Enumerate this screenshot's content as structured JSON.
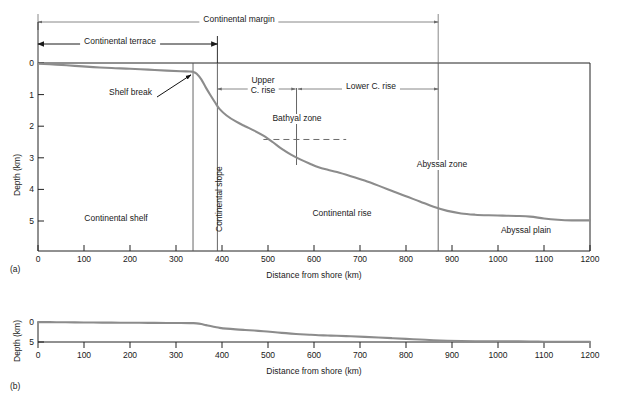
{
  "figure": {
    "panel_a_id": "(a)",
    "panel_b_id": "(b)",
    "x_axis_title": "Distance from shore (km)",
    "y_axis_title": "Depth (km)"
  },
  "axes": {
    "x_ticks": [
      0,
      100,
      200,
      300,
      400,
      500,
      600,
      700,
      800,
      900,
      1000,
      1100,
      1200
    ],
    "x_tick_labels": [
      "0",
      "100",
      "200",
      "300",
      "400",
      "500",
      "600",
      "700",
      "800",
      "900",
      "1000",
      "1100",
      "1200"
    ],
    "x_min": 0,
    "x_max": 1200,
    "y_ticks_a": [
      0,
      1,
      2,
      3,
      4,
      5
    ],
    "y_tick_labels_a": [
      "0",
      "1",
      "2",
      "3",
      "4",
      "5"
    ],
    "y_min_a": 0,
    "y_max_a": 5.6,
    "y_ticks_b": [
      0,
      5
    ],
    "y_tick_labels_b": [
      "0",
      "5"
    ],
    "y_min_b": 0,
    "y_max_b": 5.6
  },
  "brackets": {
    "continental_margin": {
      "label": "Continental margin",
      "start_km": 0,
      "end_km": 870
    },
    "continental_terrace": {
      "label": "Continental terrace",
      "start_km": 0,
      "end_km": 390
    },
    "upper_c_rise": {
      "label_line1": "Upper",
      "label_line2": "C. rise",
      "start_km": 390,
      "end_km": 560
    },
    "lower_c_rise": {
      "label": "Lower C. rise",
      "start_km": 565,
      "end_km": 870
    }
  },
  "annotations": {
    "shelf_break": {
      "label": "Shelf break",
      "point_km": 337,
      "point_depth": 0.28
    },
    "continental_shelf": {
      "label": "Continental shelf",
      "at_km": 170,
      "at_depth": 4.55
    },
    "continental_slope": {
      "label": "Continental slope",
      "at_km": 367,
      "at_depth": 3.1
    },
    "continental_rise": {
      "label": "Continental rise",
      "at_km": 660,
      "at_depth": 4.55
    },
    "bathyal_zone": {
      "label": "Bathyal zone",
      "at_km": 560,
      "at_depth": 2.05
    },
    "abyssal_zone": {
      "label": "Abyssal zone",
      "at_km": 870,
      "at_depth": 2.9
    },
    "abyssal_plain": {
      "label": "Abyssal plain",
      "at_km": 1060,
      "at_depth": 5.1
    }
  },
  "dividers": {
    "continental_slope_left_km": 337,
    "continental_slope_right_km": 390,
    "bathyal_divider_km": 562,
    "abyssal_divider_km": 870,
    "bathyal_dashed_start_km": 490,
    "bathyal_dashed_end_km": 670,
    "bathyal_dashed_depth": 2.42
  },
  "chart_data": {
    "type": "line",
    "title": "",
    "xlabel": "Distance from shore (km)",
    "ylabel": "Depth (km)",
    "xlim": [
      0,
      1200
    ],
    "ylim": [
      5.6,
      0
    ],
    "grid": false,
    "legend": "none",
    "series": [
      {
        "name": "Seafloor profile",
        "color": "#8c8c8c",
        "x": [
          0,
          40,
          80,
          120,
          160,
          200,
          240,
          280,
          310,
          330,
          337,
          345,
          355,
          365,
          375,
          385,
          395,
          410,
          430,
          450,
          470,
          490,
          510,
          530,
          550,
          570,
          590,
          610,
          630,
          650,
          680,
          710,
          740,
          770,
          800,
          830,
          860,
          890,
          920,
          950,
          980,
          1010,
          1040,
          1070,
          1100,
          1130,
          1160,
          1200
        ],
        "y": [
          0.02,
          0.05,
          0.09,
          0.13,
          0.16,
          0.18,
          0.21,
          0.24,
          0.26,
          0.27,
          0.28,
          0.34,
          0.52,
          0.78,
          1.02,
          1.25,
          1.46,
          1.66,
          1.85,
          2.0,
          2.14,
          2.3,
          2.5,
          2.72,
          2.9,
          3.05,
          3.18,
          3.3,
          3.38,
          3.45,
          3.58,
          3.72,
          3.88,
          4.05,
          4.22,
          4.38,
          4.55,
          4.68,
          4.76,
          4.8,
          4.82,
          4.83,
          4.84,
          4.86,
          4.92,
          4.96,
          4.98,
          4.98
        ]
      }
    ]
  }
}
